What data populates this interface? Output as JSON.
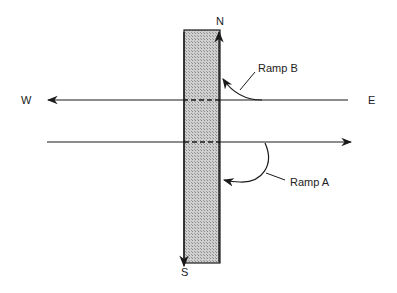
{
  "diagram": {
    "type": "interchange-schematic",
    "labels": {
      "north": "N",
      "south": "S",
      "west": "W",
      "east": "E",
      "ramp_b": "Ramp B",
      "ramp_a": "Ramp A"
    },
    "colors": {
      "line": "#1a1a1a",
      "road_fill": "#bdbdbd",
      "background": "#ffffff"
    }
  }
}
